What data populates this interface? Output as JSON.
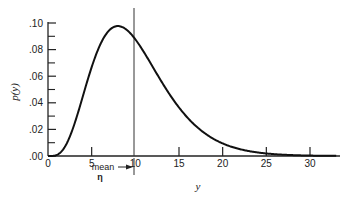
{
  "chart_data": {
    "type": "line",
    "title": "",
    "xlabel": "y",
    "ylabel": "p(y)",
    "xlim": [
      0,
      33
    ],
    "ylim": [
      0,
      0.1
    ],
    "x_ticks": [
      0,
      5,
      10,
      15,
      20,
      25,
      30
    ],
    "x_tick_labels": [
      "0",
      "5",
      "10",
      "15",
      "20",
      "25",
      "30"
    ],
    "y_ticks": [
      0.0,
      0.02,
      0.04,
      0.06,
      0.08,
      0.1
    ],
    "y_tick_labels": [
      ".00",
      ".02",
      ".04",
      ".06",
      ".08",
      ".10"
    ],
    "y_minor_ticks": [
      0.01,
      0.03,
      0.05,
      0.07,
      0.09
    ],
    "grid": false,
    "legend": null,
    "series": [
      {
        "name": "p(y)",
        "x": [
          0,
          1,
          2,
          3,
          4,
          5,
          6,
          7,
          8,
          9,
          10,
          11,
          12,
          13,
          14,
          15,
          16,
          17,
          18,
          19,
          20,
          21,
          22,
          23,
          24,
          25,
          26,
          27,
          28,
          29,
          30
        ],
        "values": [
          0.0,
          0.0016,
          0.0153,
          0.042,
          0.0722,
          0.0891,
          0.0966,
          0.0969,
          0.0977,
          0.0924,
          0.0877,
          0.0783,
          0.0669,
          0.0577,
          0.0475,
          0.0396,
          0.0305,
          0.0241,
          0.0189,
          0.0147,
          0.0113,
          0.0088,
          0.0067,
          0.0051,
          0.0039,
          0.0029,
          0.0022,
          0.0016,
          0.0012,
          0.0009,
          0.0007
        ]
      }
    ],
    "annotations": [
      {
        "type": "vline",
        "x": 10,
        "label": "mean"
      },
      {
        "type": "text",
        "text": "mean",
        "x": 7.5,
        "y_below_axis": true
      },
      {
        "type": "text",
        "text": "η",
        "x": 6.5,
        "y_below_axis": true
      },
      {
        "type": "arrow",
        "from_x": 8.2,
        "to_x": 10
      }
    ]
  },
  "labels": {
    "ylabel": "p(y)",
    "xlabel": "y",
    "mean": "mean",
    "eta": "η",
    "x_ticks": [
      "0",
      "5",
      "10",
      "15",
      "20",
      "25",
      "30"
    ],
    "y_ticks": [
      ".00",
      ".02",
      ".04",
      ".06",
      ".08",
      ".10"
    ]
  }
}
